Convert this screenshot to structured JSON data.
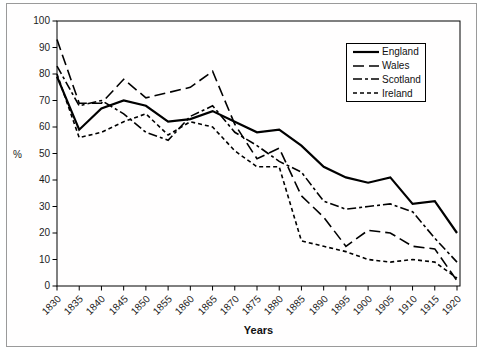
{
  "chart_data": {
    "type": "line",
    "title": "",
    "xlabel": "Years",
    "ylabel": "%",
    "x": [
      1830,
      1835,
      1840,
      1845,
      1850,
      1855,
      1860,
      1865,
      1870,
      1875,
      1880,
      1885,
      1890,
      1895,
      1900,
      1905,
      1910,
      1915,
      1920
    ],
    "ylim": [
      0,
      100
    ],
    "ytick_step": 10,
    "grid": false,
    "legend_position": "top-right",
    "line_color": "#000000",
    "series": [
      {
        "name": "England",
        "dash": "solid",
        "values": [
          79,
          59,
          67,
          70,
          68,
          62,
          63,
          66,
          62,
          58,
          59,
          53,
          45,
          41,
          39,
          41,
          31,
          32,
          20
        ]
      },
      {
        "name": "Wales",
        "dash": "long-dash",
        "values": [
          93,
          69,
          69,
          78,
          71,
          73,
          75,
          81,
          61,
          48,
          52,
          34,
          26,
          15,
          21,
          20,
          15,
          14,
          2
        ]
      },
      {
        "name": "Scotland",
        "dash": "dash-dot",
        "values": [
          83,
          68,
          70,
          65,
          58,
          55,
          64,
          68,
          58,
          53,
          47,
          43,
          32,
          29,
          30,
          31,
          28,
          18,
          9
        ]
      },
      {
        "name": "Ireland",
        "dash": "short-dash",
        "values": [
          80,
          56,
          58,
          62,
          65,
          57,
          62,
          60,
          51,
          45,
          45,
          17,
          15,
          13,
          10,
          9,
          10,
          9,
          3
        ]
      }
    ]
  },
  "axis": {
    "x_title": "Years",
    "y_title": "%"
  },
  "legend": {
    "items": [
      "England",
      "Wales",
      "Scotland",
      "Ireland"
    ]
  }
}
